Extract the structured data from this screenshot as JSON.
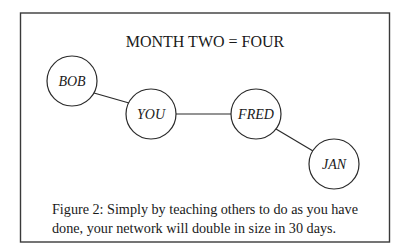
{
  "figure": {
    "title": "MONTH TWO = FOUR",
    "nodes": [
      {
        "id": "bob",
        "label": "BOB",
        "cx": 72,
        "cy": 81,
        "r": 25
      },
      {
        "id": "you",
        "label": "YOU",
        "cx": 151,
        "cy": 114,
        "r": 25
      },
      {
        "id": "fred",
        "label": "FRED",
        "cx": 256,
        "cy": 114,
        "r": 25
      },
      {
        "id": "jan",
        "label": "JAN",
        "cx": 334,
        "cy": 164,
        "r": 25
      }
    ],
    "edges": [
      {
        "from": "bob",
        "to": "you"
      },
      {
        "from": "you",
        "to": "fred"
      },
      {
        "from": "fred",
        "to": "jan"
      }
    ],
    "caption": {
      "line1": "Figure 2: Simply by teaching others to do as you have",
      "line2": "done, your network will double in size in 30 days."
    },
    "colors": {
      "stroke": "#2a2a2a",
      "text": "#1a1a1a",
      "background": "#ffffff"
    }
  }
}
